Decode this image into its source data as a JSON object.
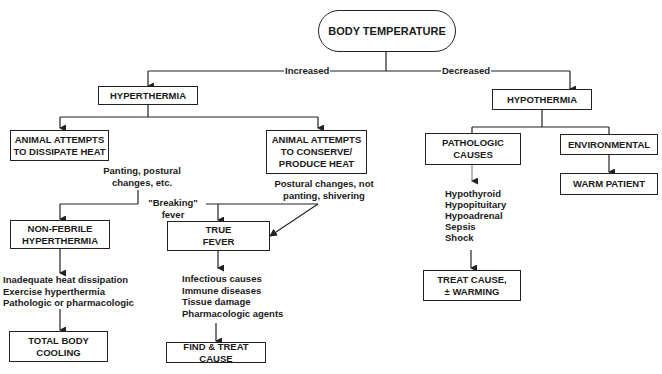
{
  "diagram": {
    "root": {
      "label": "BODY TEMPERATURE"
    },
    "edges": {
      "increased": "Increased",
      "decreased": "Decreased",
      "breaking_fever": "\"Breaking\"\nfever"
    },
    "hyperthermia": {
      "label": "HYPERTHERMIA",
      "dissipate": {
        "label": "ANIMAL ATTEMPTS\nTO DISSIPATE HEAT",
        "note": "Panting, postural\nchanges, etc."
      },
      "conserve": {
        "label": "ANIMAL ATTEMPTS\nTO CONSERVE/\nPRODUCE HEAT",
        "note": "Postural changes, not\npanting, shivering"
      },
      "non_febrile": {
        "label": "NON-FEBRILE\nHYPERTHERMIA",
        "causes": [
          "Inadequate heat dissipation",
          "Exercise hyperthermia",
          "Pathologic or pharmacologic"
        ],
        "causes_text": "Inadequate heat dissipation\nExercise hyperthermia\nPathologic or pharmacologic",
        "action": "TOTAL BODY\nCOOLING"
      },
      "true_fever": {
        "label": "TRUE\nFEVER",
        "causes": [
          "Infectious causes",
          "Immune diseases",
          "Tissue damage",
          "Pharmacologic agents"
        ],
        "causes_text": "Infectious causes\nImmune diseases\nTissue damage\nPharmacologic agents",
        "action": "FIND & TREAT CAUSE"
      }
    },
    "hypothermia": {
      "label": "HYPOTHERMIA",
      "pathologic": {
        "label": "PATHOLOGIC\nCAUSES",
        "causes": [
          "Hypothyroid",
          "Hypopituitary",
          "Hypoadrenal",
          "Sepsis",
          "Shock"
        ],
        "causes_text": "Hypothyroid\nHypopituitary\nHypoadrenal\nSepsis\nShock",
        "action": "TREAT CAUSE,\n± WARMING"
      },
      "environmental": {
        "label": "ENVIRONMENTAL",
        "action": "WARM PATIENT"
      }
    }
  }
}
